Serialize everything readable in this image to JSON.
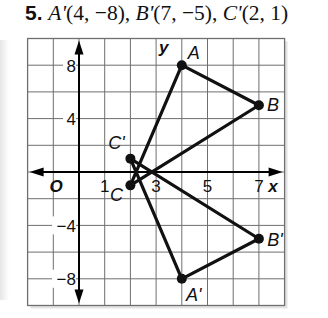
{
  "problem": {
    "number": "5.",
    "points_text": [
      {
        "name": "A'",
        "coords": "(4, −8)"
      },
      {
        "name": "B'",
        "coords": "(7, −5)"
      },
      {
        "name": "C'",
        "coords": "(2, 1)"
      }
    ]
  },
  "graph": {
    "x_range": [
      -2,
      8
    ],
    "y_range": [
      -10,
      10
    ],
    "x_grid_step": 1,
    "y_grid_step": 2,
    "axis_labels": {
      "x": "x",
      "y": "y",
      "origin": "O"
    },
    "x_tick_labels": [
      "1",
      "3",
      "5",
      "7"
    ],
    "y_tick_labels": [
      "8",
      "4",
      "−4",
      "−8"
    ],
    "triangles": {
      "original": [
        {
          "label": "A",
          "x": 4,
          "y": 8
        },
        {
          "label": "B",
          "x": 7,
          "y": 5
        },
        {
          "label": "C",
          "x": 2,
          "y": -1
        }
      ],
      "image": [
        {
          "label": "A'",
          "x": 4,
          "y": -8
        },
        {
          "label": "B'",
          "x": 7,
          "y": -5
        },
        {
          "label": "C'",
          "x": 2,
          "y": 1
        }
      ]
    },
    "colors": {
      "grid": "#6f6f6f",
      "axes": "#000000",
      "triangle": "#111111",
      "shadow": "#d9d9d9"
    }
  }
}
